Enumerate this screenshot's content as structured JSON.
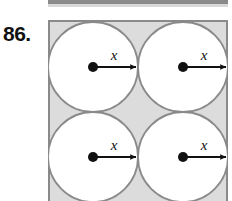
{
  "figure": {
    "problem_number": "86.",
    "caption_label": "x",
    "colors": {
      "square_fill": "#dcdcdc",
      "square_stroke": "#8a8a8a",
      "circle_fill": "#ffffff",
      "circle_stroke": "#8a8a8a",
      "arrow": "#111111",
      "dot": "#111111",
      "text": "#111111",
      "top_fragment": "#8a8a8a"
    },
    "square": {
      "x": 0,
      "y": 0,
      "width": 180,
      "height": 190,
      "stroke_width": 2
    },
    "circles": [
      {
        "name": "circle-top-left",
        "cx": 45,
        "cy": 47,
        "r": 45,
        "label": "x",
        "label_x": 70,
        "label_y": 39,
        "arrow_x1": 45,
        "arrow_y1": 47,
        "arrow_x2": 90,
        "arrow_y2": 47
      },
      {
        "name": "circle-top-right",
        "cx": 135,
        "cy": 47,
        "r": 45,
        "label": "x",
        "label_x": 160,
        "label_y": 39,
        "arrow_x1": 135,
        "arrow_y1": 47,
        "arrow_x2": 180,
        "arrow_y2": 47
      },
      {
        "name": "circle-bottom-left",
        "cx": 45,
        "cy": 137,
        "r": 45,
        "label": "x",
        "label_x": 70,
        "label_y": 129,
        "arrow_x1": 45,
        "arrow_y1": 137,
        "arrow_x2": 90,
        "arrow_y2": 137
      },
      {
        "name": "circle-bottom-right",
        "cx": 135,
        "cy": 137,
        "r": 45,
        "label": "x",
        "label_x": 160,
        "label_y": 129,
        "arrow_x1": 135,
        "arrow_y1": 137,
        "arrow_x2": 180,
        "arrow_y2": 137
      }
    ],
    "dot_radius": 5,
    "grid": {
      "rows": 2,
      "cols": 2
    }
  }
}
